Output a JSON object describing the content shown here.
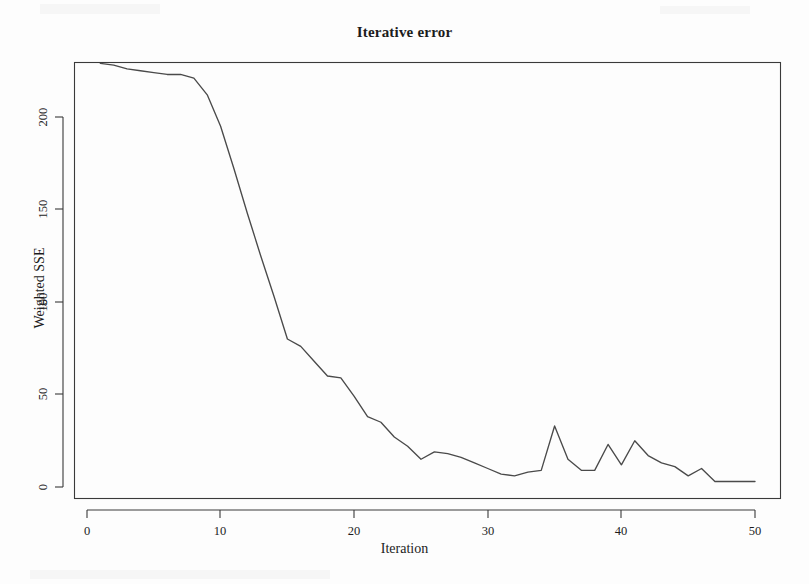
{
  "figure": {
    "title": "Iterative error",
    "background_color": "#fdfdfd",
    "line_color": "#4a4a4a",
    "axis_color": "#3a3a3a"
  },
  "axes": {
    "x_label": "Iteration",
    "y_label": "Weighted SSE",
    "x_ticks": [
      "0",
      "10",
      "20",
      "30",
      "40",
      "50"
    ],
    "y_ticks": [
      "0",
      "50",
      "100",
      "150",
      "200"
    ]
  },
  "chart_data": {
    "type": "line",
    "title": "Iterative error",
    "xlabel": "Iteration",
    "ylabel": "Weighted SSE",
    "xlim": [
      0,
      51
    ],
    "ylim": [
      -2,
      236
    ],
    "x_ticks": [
      0,
      10,
      20,
      30,
      40,
      50
    ],
    "y_ticks": [
      0,
      50,
      100,
      150,
      200
    ],
    "grid": false,
    "legend": false,
    "series": [
      {
        "name": "Weighted SSE",
        "color": "#4a4a4a",
        "x": [
          1,
          2,
          3,
          4,
          5,
          6,
          7,
          8,
          9,
          10,
          11,
          12,
          13,
          14,
          15,
          16,
          17,
          18,
          19,
          20,
          21,
          22,
          23,
          24,
          25,
          26,
          27,
          28,
          29,
          30,
          31,
          32,
          33,
          34,
          35,
          36,
          37,
          38,
          39,
          40,
          41,
          42,
          43,
          44,
          45,
          46,
          47,
          48,
          49,
          50
        ],
        "values": [
          229,
          228,
          226,
          225,
          224,
          223,
          223,
          221,
          212,
          195,
          172,
          148,
          125,
          103,
          80,
          76,
          68,
          60,
          59,
          49,
          38,
          35,
          27,
          22,
          15,
          19,
          18,
          16,
          13,
          10,
          7,
          6,
          8,
          9,
          33,
          15,
          9,
          9,
          23,
          12,
          25,
          17,
          13,
          11,
          6,
          10,
          3,
          3,
          3,
          3
        ]
      }
    ]
  }
}
